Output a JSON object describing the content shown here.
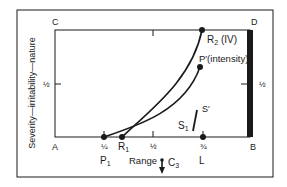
{
  "figure": {
    "y_axis_label": "Severity—irritability—nature",
    "corners": {
      "top_left": "C",
      "top_right": "D",
      "bottom_left": "A",
      "bottom_right": "B"
    },
    "left_half_tick": "½",
    "right_half_tick": "½",
    "x_ticks": {
      "quarter": "¼",
      "half": "½",
      "three_quarter": "¾"
    },
    "points": {
      "p1": "P",
      "p1_sub": "1",
      "r1": "R",
      "r1_sub": "1",
      "r2": "R",
      "r2_sub": "2",
      "r2_suffix": " (IV)",
      "p_prime": "P′(intensity)",
      "s1": "S",
      "s1_sub": "1",
      "s_prime": "S′",
      "l": "L"
    },
    "range_label": "Range",
    "c3": "C",
    "c3_sub": "3",
    "colors": {
      "ink": "#1a1a1a",
      "background": "#ffffff"
    }
  }
}
